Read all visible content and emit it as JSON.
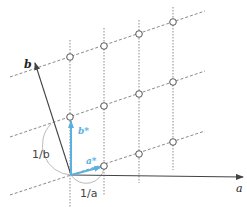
{
  "diagram": {
    "labels": {
      "a": "a",
      "b": "b",
      "a_star": "a*",
      "b_star": "b*",
      "inv_a": "1/a",
      "inv_b": "1/b"
    },
    "colors": {
      "reciprocal_vector": "#5ab0e0",
      "axis": "#444444",
      "lattice_line": "#888888",
      "arc": "#bbbbbb"
    },
    "lattice_points": [
      {
        "col": 0,
        "row": 1,
        "x": 70,
        "y": 117
      },
      {
        "col": 0,
        "row": 2,
        "x": 70,
        "y": 57
      },
      {
        "col": 1,
        "row": 0,
        "x": 104,
        "y": 166
      },
      {
        "col": 1,
        "row": 1,
        "x": 104,
        "y": 106
      },
      {
        "col": 1,
        "row": 2,
        "x": 104,
        "y": 46
      },
      {
        "col": 2,
        "row": 0,
        "x": 139,
        "y": 154
      },
      {
        "col": 2,
        "row": 1,
        "x": 139,
        "y": 94
      },
      {
        "col": 2,
        "row": 2,
        "x": 139,
        "y": 34
      },
      {
        "col": 3,
        "row": 0,
        "x": 173,
        "y": 142
      },
      {
        "col": 3,
        "row": 1,
        "x": 173,
        "y": 82
      },
      {
        "col": 3,
        "row": 2,
        "x": 173,
        "y": 22
      }
    ]
  }
}
